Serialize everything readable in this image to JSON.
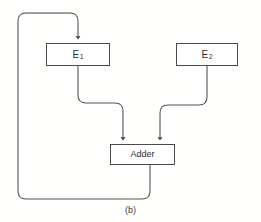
{
  "figure": {
    "caption": "(b)",
    "background_color": "#fffffe",
    "line_color": "#555555",
    "box_border_color": "#4a4a4a",
    "box_fill_color": "#ffffff",
    "feedback_tint_color": "#4e8a72",
    "text_color": "#2b2b2b"
  },
  "nodes": {
    "e1": {
      "label_base": "E",
      "label_sub": "1",
      "x": 46,
      "y": 43,
      "width": 64,
      "height": 23
    },
    "e2": {
      "label_base": "E",
      "label_sub": "2",
      "x": 176,
      "y": 43,
      "width": 62,
      "height": 23
    },
    "adder": {
      "label": "Adder",
      "x": 110,
      "y": 144,
      "width": 65,
      "height": 21
    }
  },
  "edges": [
    {
      "name": "e1-to-adder",
      "from": "e1",
      "to": "adder",
      "arrowhead": "down",
      "path": "M 78 66 L 78 95 Q 78 103 86 103 L 115 103 Q 123 103 123 111 L 123 138"
    },
    {
      "name": "e2-to-adder",
      "from": "e2",
      "to": "adder",
      "arrowhead": "down",
      "path": "M 207 66 L 207 97 Q 207 105 199 105 L 168 105 Q 160 105 160 113 L 160 138"
    },
    {
      "name": "adder-feedback-to-e1",
      "from": "adder",
      "to": "e1",
      "arrowhead": "down",
      "path": "M 150 165 L 150 191 Q 150 199 142 199 L 26 199 Q 18 199 18 191 L 18 21 Q 18 13 26 13 L 70 13 Q 78 13 78 21 L 78 37"
    }
  ]
}
